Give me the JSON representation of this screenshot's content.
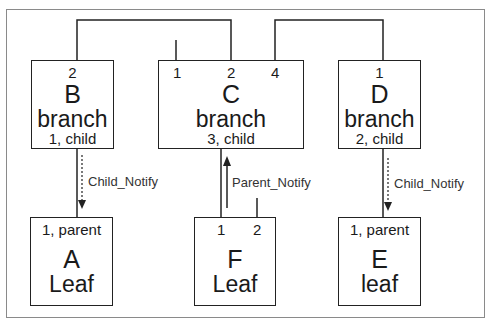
{
  "diagram": {
    "type": "hierarchy",
    "nodes": {
      "B": {
        "port": "2",
        "letter": "B",
        "kind": "branch",
        "role": "1, child"
      },
      "C": {
        "ports": [
          "1",
          "2",
          "4"
        ],
        "letter": "C",
        "kind": "branch",
        "role": "3, child"
      },
      "D": {
        "port": "1",
        "letter": "D",
        "kind": "branch",
        "role": "2, child"
      },
      "A": {
        "role": "1, parent",
        "letter": "A",
        "kind": "Leaf"
      },
      "F": {
        "ports": [
          "1",
          "2"
        ],
        "letter": "F",
        "kind": "Leaf"
      },
      "E": {
        "role": "1, parent",
        "letter": "E",
        "kind": "leaf"
      }
    },
    "edges": [
      {
        "from": "B.2",
        "to": "C.2"
      },
      {
        "from": "C.4",
        "to": "D.1"
      },
      {
        "from": "B.1",
        "to": "A.1",
        "label": "Child_Notify",
        "direction": "down",
        "style": "dashed"
      },
      {
        "from": "C.3",
        "to": "F.1",
        "label": "Parent_Notify",
        "direction": "up",
        "style": "solid"
      },
      {
        "from": "D.2",
        "to": "E.1",
        "label": "Child_Notify",
        "direction": "down",
        "style": "dashed"
      }
    ],
    "labels": {
      "b_to_a": "Child_Notify",
      "f_to_c": "Parent_Notify",
      "d_to_e": "Child_Notify"
    }
  }
}
